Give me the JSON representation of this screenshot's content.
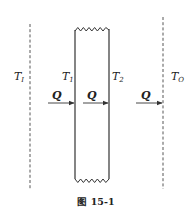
{
  "diagram": {
    "type": "heat-conduction-slab",
    "colors": {
      "line": "#333333",
      "text": "#222222",
      "background": "#ffffff"
    },
    "boundaries": {
      "inner_fluid": {
        "label_main": "T",
        "label_sub": "I"
      },
      "outer_fluid": {
        "label_main": "T",
        "label_sub": "O"
      }
    },
    "wall": {
      "left_surface": {
        "label_main": "T",
        "label_sub": "1"
      },
      "right_surface": {
        "label_main": "T",
        "label_sub": "2"
      }
    },
    "heat_flows": [
      {
        "label": "Q",
        "region": "inner-fluid-to-wall"
      },
      {
        "label": "Q",
        "region": "through-wall"
      },
      {
        "label": "Q",
        "region": "wall-to-outer-fluid"
      }
    ],
    "caption": "图 15-1"
  }
}
